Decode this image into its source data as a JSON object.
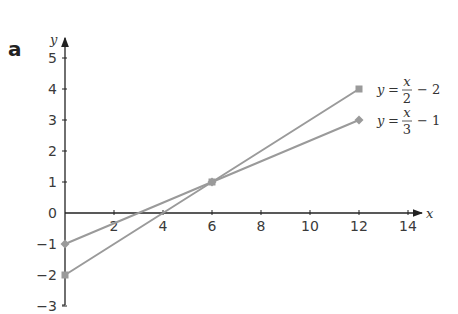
{
  "part_label": "a",
  "chart_data": {
    "type": "line",
    "title": "",
    "xlabel": "x",
    "ylabel": "y",
    "xlim": [
      0,
      14
    ],
    "ylim": [
      -3,
      5
    ],
    "grid": false,
    "x_ticks": [
      "2",
      "4",
      "6",
      "8",
      "10",
      "12",
      "14"
    ],
    "y_ticks": [
      "-3",
      "-2",
      "-1",
      "0",
      "1",
      "2",
      "3",
      "4",
      "5"
    ],
    "series": [
      {
        "name": "y = x/2 − 2",
        "marker": "square",
        "color": "#9a9a9a",
        "points": [
          [
            0,
            -2
          ],
          [
            6,
            1
          ],
          [
            12,
            4
          ]
        ],
        "label": {
          "lhs": "y",
          "eq": "=",
          "num": "x",
          "den": "2",
          "rest": "− 2"
        }
      },
      {
        "name": "y = x/3 − 1",
        "marker": "diamond",
        "color": "#9a9a9a",
        "points": [
          [
            0,
            -1
          ],
          [
            6,
            1
          ],
          [
            12,
            3
          ]
        ],
        "label": {
          "lhs": "y",
          "eq": "=",
          "num": "x",
          "den": "3",
          "rest": "− 1"
        }
      }
    ],
    "annotations": [
      "intersection at (6, 1)"
    ],
    "legend_position": "inline-right"
  }
}
